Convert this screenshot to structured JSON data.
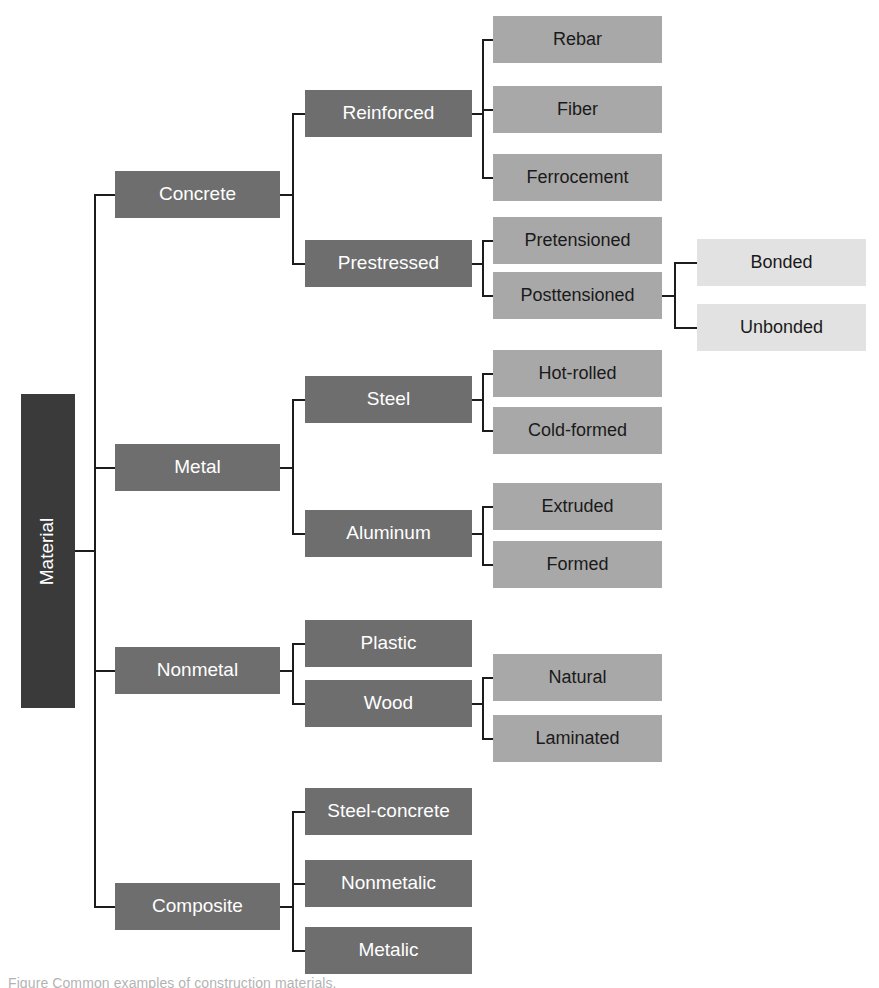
{
  "figure": {
    "type": "hierarchy-tree",
    "orientation": "left-to-right",
    "title": "Material",
    "caption": "Figure  Common examples of construction materials.",
    "colors": {
      "root_fill": "#3a3a3a",
      "level1_fill": "#6e6e6e",
      "level2_fill": "#6e6e6e",
      "level3_fill": "#a8a8a8",
      "level4_fill": "#e2e2e2",
      "connector": "#1c1c1c",
      "light_text": "#ffffff",
      "dark_text": "#1a1a1a",
      "background": "#ffffff"
    }
  },
  "nodes": {
    "root": "Material",
    "concrete": "Concrete",
    "reinforced": "Reinforced",
    "rebar": "Rebar",
    "fiber": "Fiber",
    "ferrocement": "Ferrocement",
    "prestressed": "Prestressed",
    "pretensioned": "Pretensioned",
    "posttensioned": "Posttensioned",
    "bonded": "Bonded",
    "unbonded": "Unbonded",
    "metal": "Metal",
    "steel": "Steel",
    "hot_rolled": "Hot-rolled",
    "cold_formed": "Cold-formed",
    "aluminum": "Aluminum",
    "extruded": "Extruded",
    "formed": "Formed",
    "nonmetal": "Nonmetal",
    "plastic": "Plastic",
    "wood": "Wood",
    "natural": "Natural",
    "laminated": "Laminated",
    "composite": "Composite",
    "steel_concrete": "Steel-concrete",
    "nonmetalic": "Nonmetalic",
    "metalic": "Metalic"
  },
  "tree": {
    "name": "Material",
    "children": [
      {
        "name": "Concrete",
        "children": [
          {
            "name": "Reinforced",
            "children": [
              {
                "name": "Rebar"
              },
              {
                "name": "Fiber"
              },
              {
                "name": "Ferrocement"
              }
            ]
          },
          {
            "name": "Prestressed",
            "children": [
              {
                "name": "Pretensioned"
              },
              {
                "name": "Posttensioned",
                "children": [
                  {
                    "name": "Bonded"
                  },
                  {
                    "name": "Unbonded"
                  }
                ]
              }
            ]
          }
        ]
      },
      {
        "name": "Metal",
        "children": [
          {
            "name": "Steel",
            "children": [
              {
                "name": "Hot-rolled"
              },
              {
                "name": "Cold-formed"
              }
            ]
          },
          {
            "name": "Aluminum",
            "children": [
              {
                "name": "Extruded"
              },
              {
                "name": "Formed"
              }
            ]
          }
        ]
      },
      {
        "name": "Nonmetal",
        "children": [
          {
            "name": "Plastic"
          },
          {
            "name": "Wood",
            "children": [
              {
                "name": "Natural"
              },
              {
                "name": "Laminated"
              }
            ]
          }
        ]
      },
      {
        "name": "Composite",
        "children": [
          {
            "name": "Steel-concrete"
          },
          {
            "name": "Nonmetalic"
          },
          {
            "name": "Metalic"
          }
        ]
      }
    ]
  }
}
